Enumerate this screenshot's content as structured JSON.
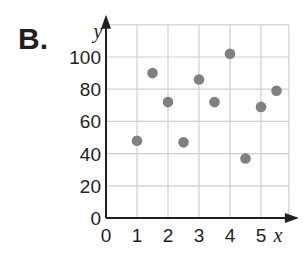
{
  "problem_label": "B.",
  "colors": {
    "grid": "#cfcfcf",
    "axis": "#231f20",
    "point": "#808080",
    "text": "#231f20"
  },
  "chart_data": {
    "type": "scatter",
    "title": "",
    "xlabel": "x",
    "ylabel": "y",
    "xlim": [
      0,
      5.9
    ],
    "ylim": [
      0,
      120
    ],
    "grid": true,
    "legend": null,
    "x_ticks": [
      0,
      1,
      2,
      3,
      4,
      5
    ],
    "y_ticks": [
      0,
      20,
      40,
      60,
      80,
      100
    ],
    "points": [
      {
        "x": 1.0,
        "y": 48
      },
      {
        "x": 1.5,
        "y": 90
      },
      {
        "x": 2.0,
        "y": 72
      },
      {
        "x": 2.5,
        "y": 47
      },
      {
        "x": 3.0,
        "y": 86
      },
      {
        "x": 3.5,
        "y": 72
      },
      {
        "x": 4.0,
        "y": 102
      },
      {
        "x": 4.5,
        "y": 37
      },
      {
        "x": 5.0,
        "y": 69
      },
      {
        "x": 5.5,
        "y": 79
      }
    ]
  }
}
